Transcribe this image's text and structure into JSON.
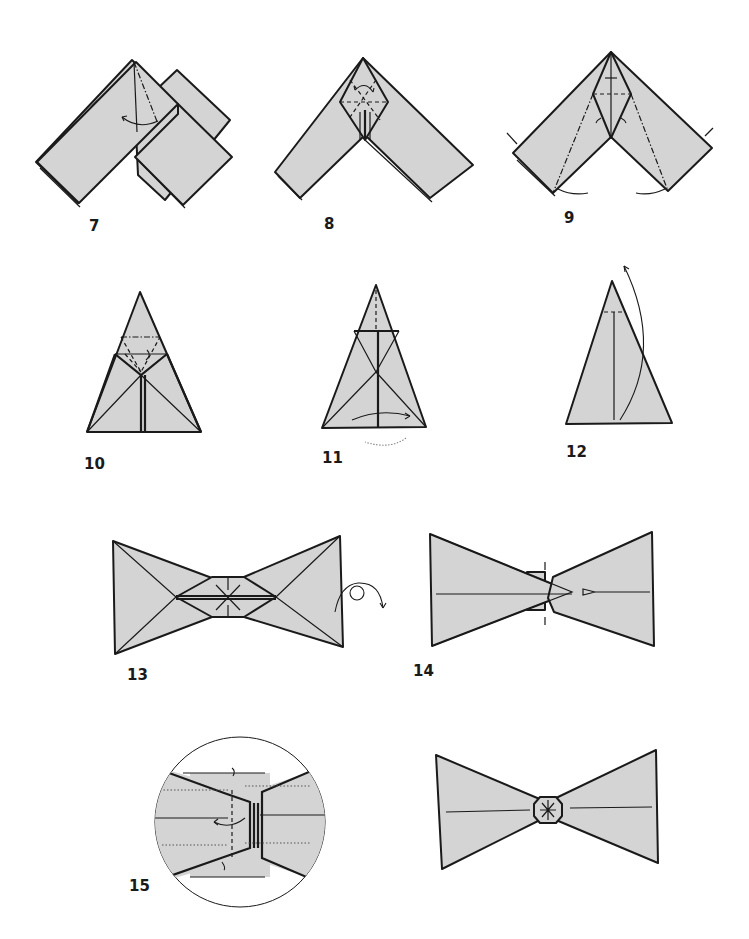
{
  "page": {
    "colors": {
      "paper": "#d4d4d4",
      "line": "#1a1a1a",
      "background": "#ffffff"
    }
  },
  "steps": [
    {
      "number": "7",
      "shape": "inverted V of two folded strips",
      "symbols": [
        "mountain-fold-line",
        "curved-arrow-left"
      ]
    },
    {
      "number": "8",
      "shape": "inverted V with kite at apex",
      "symbols": [
        "valley-fold-lines",
        "curved-arrow"
      ]
    },
    {
      "number": "9",
      "shape": "inverted V with kite, squash folds",
      "symbols": [
        "mountain-fold-lines",
        "push-arrows",
        "swing-arrows"
      ]
    },
    {
      "number": "10",
      "shape": "triangle with inner kite",
      "symbols": [
        "valley-fold-lines",
        "tuck-arrow"
      ]
    },
    {
      "number": "11",
      "shape": "triangle with center crease",
      "symbols": [
        "curved-arrow-right",
        "dotted-arrow-behind"
      ]
    },
    {
      "number": "12",
      "shape": "triangle folded in half",
      "symbols": [
        "valley-fold-line",
        "long-curved-arrow-up"
      ]
    },
    {
      "number": "13",
      "shape": "bow tie with center band",
      "symbols": [
        "radial-crease-lines"
      ]
    },
    {
      "number": "14",
      "shape": "bow tie (turned over)",
      "symbols": [
        "turn-over-arrow",
        "push-arrow",
        "pinch-marks"
      ]
    },
    {
      "number": "15",
      "shape": "close-up circle of center pleats",
      "symbols": [
        "mountain-fold-line",
        "curved-arrow",
        "tuck-arrows"
      ]
    },
    {
      "number": "",
      "shape": "finished bow tie with octagonal knot",
      "symbols": []
    }
  ]
}
